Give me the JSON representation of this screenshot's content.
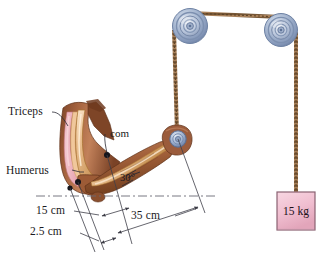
{
  "figure": {
    "background_color": "#ffffff"
  },
  "labels": {
    "triceps": "Triceps",
    "humerus": "Humerus",
    "com": "com",
    "angle": "30°",
    "dim_15": "15 cm",
    "dim_25": "2.5 cm",
    "dim_35": "35 cm",
    "mass": "15 kg"
  },
  "colors": {
    "skin": "#9b5c3c",
    "skin_light": "#c08360",
    "skin_dark": "#6d3a22",
    "muscle_pink": "#edb3bd",
    "muscle_pink_dark": "#d98c9c",
    "bone": "#e8b887",
    "bone_light": "#f7ddc0",
    "bone_edge": "#b2793f",
    "pulley_blue": "#9aacc8",
    "pulley_blue_dark": "#6f84a6",
    "pulley_blue_light": "#ccd6e6",
    "rope": "#a07a52",
    "rope_dark": "#6f5232",
    "mass_box_fill": "#f2c3d3",
    "mass_box_stroke": "#8a6272",
    "leader": "#2a2a33",
    "dimension": "#55555f",
    "text": "#1a1a22"
  },
  "geometry": {
    "pulley_left": {
      "cx": 190,
      "cy": 26,
      "r": 17
    },
    "pulley_right": {
      "cx": 281,
      "cy": 30,
      "r": 16
    },
    "pulley_hand": {
      "cx": 178,
      "cy": 139,
      "r": 8
    },
    "mass_box": {
      "x": 277,
      "y": 192,
      "w": 38,
      "h": 38
    },
    "angle_value_deg": 30,
    "com_point": {
      "x": 107,
      "y": 155
    },
    "joint_point": {
      "x": 78,
      "y": 182
    },
    "insertion_point": {
      "x": 70,
      "y": 188
    }
  },
  "annotations": {
    "dim_15_desc": "distance from elbow joint to center of mass",
    "dim_25_desc": "triceps insertion lever arm",
    "dim_35_desc": "distance from elbow joint to hand / cord attachment"
  }
}
